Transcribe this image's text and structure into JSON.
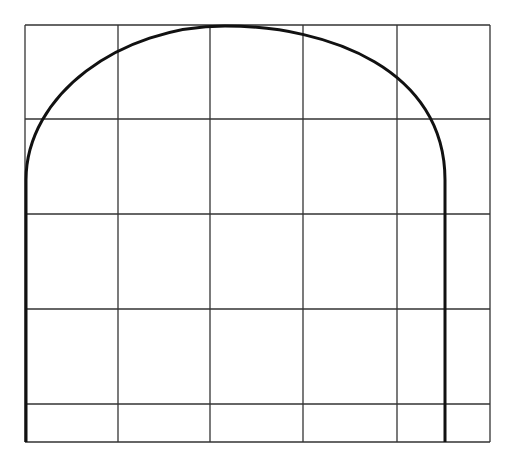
{
  "diagram": {
    "type": "grid-with-arch-outline",
    "canvas": {
      "width": 517,
      "height": 465,
      "background": "#ffffff"
    },
    "grid": {
      "stroke": "#333333",
      "stroke_width": 1.3,
      "vertical_lines_x": [
        25,
        118,
        210,
        303,
        397,
        490
      ],
      "horizontal_lines_y": [
        25,
        119,
        214,
        309,
        404,
        442
      ],
      "top": 25,
      "bottom": 442,
      "left": 25,
      "right": 490
    },
    "arch": {
      "stroke": "#111111",
      "stroke_width": 3,
      "left_x": 26,
      "right_x": 445,
      "bottom_y": 442,
      "spring_y": 180,
      "peak_y": 26,
      "peak_x": 225
    }
  }
}
